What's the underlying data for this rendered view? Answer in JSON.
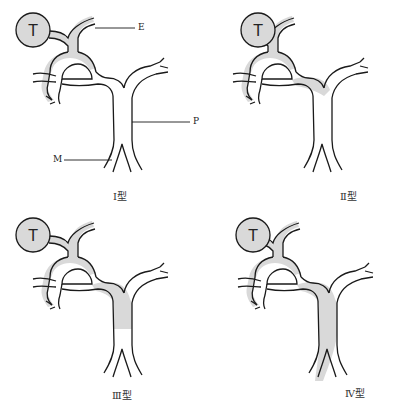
{
  "diagram": {
    "colors": {
      "stroke": "#1a1a1a",
      "shade": "#d9d9d9",
      "tumor_fill": "#d9d9d9",
      "background": "#ffffff"
    },
    "tumor_label": "T",
    "callouts": {
      "E": "E",
      "P": "P",
      "M": "M"
    },
    "panels": [
      {
        "id": "type-1",
        "caption": "Ⅰ型",
        "shading": "tumor and adjacent ducts only"
      },
      {
        "id": "type-2",
        "caption": "Ⅱ型",
        "shading": "extends to confluence with main trunk"
      },
      {
        "id": "type-3",
        "caption": "Ⅲ型",
        "shading": "extends down upper main trunk (partial)"
      },
      {
        "id": "type-4",
        "caption": "Ⅳ型",
        "shading": "extends along full left side of main trunk"
      }
    ]
  }
}
